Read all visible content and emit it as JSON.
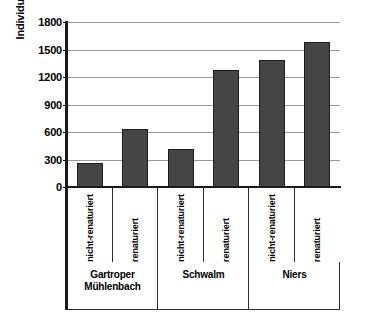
{
  "chart_data": {
    "type": "bar",
    "title": "",
    "xlabel": "",
    "ylabel": "Individuen/m²",
    "ylim": [
      0,
      1800
    ],
    "ytick_step": 300,
    "yticks": [
      1800,
      1500,
      1200,
      900,
      600,
      300,
      0
    ],
    "ytick_labels": [
      "1800",
      "1500",
      "1200",
      "900",
      "600",
      "300",
      "0"
    ],
    "grid": true,
    "legend": "none",
    "bar_color": "#454545",
    "bar_edge_color": "#1c1c1c",
    "gridline_color": "#9a9a9a",
    "axis_color": "#1a1a1a",
    "categories": [
      "nicht-renaturiert",
      "renaturiert",
      "nicht-renaturiert",
      "renaturiert",
      "nicht-renaturiert",
      "renaturiert"
    ],
    "values": [
      265,
      635,
      410,
      1275,
      1385,
      1585
    ],
    "groups": [
      {
        "label": "Gartroper Mühlenbach",
        "lines": [
          "Gartroper",
          "Mühlenbach"
        ],
        "span": 2
      },
      {
        "label": "Schwalm",
        "lines": [
          "Schwalm"
        ],
        "span": 2
      },
      {
        "label": "Niers",
        "lines": [
          "Niers"
        ],
        "span": 2
      }
    ],
    "series": [
      {
        "name": "Individuen/m²",
        "values": [
          265,
          635,
          410,
          1275,
          1385,
          1585
        ]
      }
    ]
  }
}
